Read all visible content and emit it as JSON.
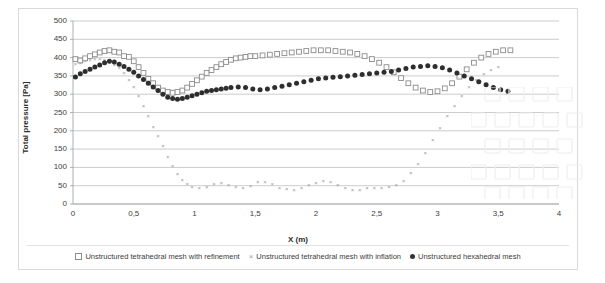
{
  "chart_data": {
    "type": "scatter",
    "title": "",
    "xlabel": "X (m)",
    "ylabel": "Total pressure [Pa]",
    "xlim": [
      0,
      4
    ],
    "ylim": [
      0,
      500
    ],
    "xticks": [
      "0",
      "0,5",
      "1",
      "1,5",
      "2",
      "2,5",
      "3",
      "3,5",
      "4"
    ],
    "xtick_values": [
      0,
      0.5,
      1,
      1.5,
      2,
      2.5,
      3,
      3.5,
      4
    ],
    "yticks": [
      "0",
      "50",
      "100",
      "150",
      "200",
      "250",
      "300",
      "350",
      "400",
      "450",
      "500"
    ],
    "ytick_values": [
      0,
      50,
      100,
      150,
      200,
      250,
      300,
      350,
      400,
      450,
      500
    ],
    "grid": "horizontal",
    "legend_position": "bottom",
    "series": [
      {
        "name": "Unstructured tetrahedral mesh with refinement",
        "marker": "open-square",
        "color": "#8c8c8c",
        "x": [
          0.02,
          0.06,
          0.1,
          0.14,
          0.18,
          0.22,
          0.26,
          0.3,
          0.34,
          0.38,
          0.42,
          0.46,
          0.5,
          0.54,
          0.58,
          0.62,
          0.66,
          0.7,
          0.74,
          0.78,
          0.82,
          0.86,
          0.9,
          0.94,
          0.98,
          1.02,
          1.06,
          1.1,
          1.14,
          1.18,
          1.22,
          1.26,
          1.3,
          1.34,
          1.38,
          1.42,
          1.46,
          1.5,
          1.56,
          1.62,
          1.68,
          1.74,
          1.8,
          1.86,
          1.92,
          1.98,
          2.04,
          2.1,
          2.16,
          2.22,
          2.28,
          2.34,
          2.4,
          2.46,
          2.52,
          2.58,
          2.64,
          2.7,
          2.76,
          2.82,
          2.88,
          2.94,
          3.0,
          3.06,
          3.12,
          3.18,
          3.24,
          3.3,
          3.36,
          3.42,
          3.48,
          3.54,
          3.6
        ],
        "y": [
          396,
          392,
          398,
          404,
          409,
          414,
          418,
          420,
          416,
          414,
          404,
          402,
          390,
          374,
          358,
          342,
          330,
          318,
          310,
          306,
          304,
          306,
          310,
          318,
          328,
          338,
          348,
          358,
          366,
          374,
          382,
          388,
          394,
          398,
          400,
          402,
          404,
          404,
          406,
          408,
          410,
          412,
          414,
          416,
          418,
          420,
          420,
          420,
          418,
          416,
          414,
          410,
          404,
          396,
          386,
          374,
          360,
          344,
          330,
          318,
          310,
          306,
          308,
          316,
          330,
          348,
          368,
          386,
          400,
          410,
          416,
          420,
          420
        ]
      },
      {
        "name": "Unstructured tetrahedral  mesh with inflation",
        "marker": "x",
        "color": "#9a9a9a",
        "x": [
          0.02,
          0.06,
          0.1,
          0.14,
          0.18,
          0.22,
          0.26,
          0.3,
          0.34,
          0.38,
          0.42,
          0.46,
          0.5,
          0.54,
          0.58,
          0.62,
          0.66,
          0.7,
          0.74,
          0.78,
          0.82,
          0.86,
          0.9,
          0.94,
          0.98,
          1.04,
          1.1,
          1.16,
          1.22,
          1.28,
          1.34,
          1.4,
          1.46,
          1.52,
          1.58,
          1.64,
          1.7,
          1.76,
          1.82,
          1.88,
          1.94,
          2.0,
          2.06,
          2.12,
          2.18,
          2.24,
          2.3,
          2.36,
          2.42,
          2.48,
          2.54,
          2.6,
          2.66,
          2.72,
          2.78,
          2.84,
          2.9,
          2.96,
          3.02,
          3.08,
          3.14,
          3.2,
          3.26,
          3.32,
          3.38,
          3.44,
          3.5
        ],
        "y": [
          382,
          386,
          390,
          394,
          396,
          398,
          394,
          388,
          380,
          372,
          358,
          340,
          320,
          296,
          268,
          240,
          212,
          186,
          158,
          130,
          104,
          82,
          66,
          54,
          48,
          44,
          48,
          56,
          58,
          52,
          46,
          44,
          50,
          60,
          62,
          54,
          44,
          42,
          40,
          44,
          52,
          58,
          64,
          62,
          52,
          44,
          40,
          40,
          44,
          44,
          44,
          46,
          52,
          64,
          84,
          110,
          140,
          175,
          208,
          240,
          268,
          296,
          320,
          340,
          356,
          366,
          374
        ]
      },
      {
        "name": "Unstructured hexahedral mesh",
        "marker": "filled-circle",
        "color": "#2e2e2e",
        "x": [
          0.02,
          0.06,
          0.1,
          0.14,
          0.18,
          0.22,
          0.26,
          0.3,
          0.34,
          0.38,
          0.42,
          0.46,
          0.5,
          0.54,
          0.58,
          0.62,
          0.66,
          0.7,
          0.74,
          0.78,
          0.82,
          0.86,
          0.9,
          0.94,
          0.98,
          1.02,
          1.06,
          1.1,
          1.14,
          1.18,
          1.22,
          1.26,
          1.3,
          1.36,
          1.42,
          1.48,
          1.54,
          1.6,
          1.66,
          1.72,
          1.78,
          1.84,
          1.9,
          1.96,
          2.02,
          2.08,
          2.14,
          2.2,
          2.26,
          2.32,
          2.38,
          2.44,
          2.5,
          2.56,
          2.62,
          2.68,
          2.74,
          2.8,
          2.86,
          2.92,
          2.98,
          3.04,
          3.1,
          3.16,
          3.22,
          3.28,
          3.34,
          3.4,
          3.46,
          3.52,
          3.58
        ],
        "y": [
          347,
          356,
          362,
          368,
          374,
          380,
          386,
          390,
          388,
          382,
          376,
          368,
          360,
          350,
          340,
          330,
          320,
          310,
          300,
          292,
          288,
          286,
          288,
          292,
          296,
          300,
          304,
          308,
          310,
          312,
          314,
          316,
          318,
          320,
          318,
          314,
          312,
          314,
          318,
          322,
          326,
          330,
          334,
          338,
          342,
          344,
          346,
          348,
          350,
          352,
          354,
          356,
          358,
          360,
          362,
          366,
          370,
          374,
          376,
          378,
          376,
          372,
          366,
          358,
          350,
          342,
          334,
          326,
          318,
          312,
          308
        ],
        "y_note": "descending-right-tail applied after x=3.0 in rendered path"
      }
    ]
  },
  "legend": {
    "items": [
      {
        "label": "Unstructured tetrahedral mesh with refinement",
        "marker": "open-square"
      },
      {
        "label": "Unstructured tetrahedral  mesh with inflation",
        "marker": "x"
      },
      {
        "label": "Unstructured hexahedral mesh",
        "marker": "filled-circle"
      }
    ]
  },
  "colors": {
    "grid": "#bfbfbf",
    "frame": "#d9d9d9",
    "axis": "#a6a6a6",
    "text": "#404040"
  }
}
